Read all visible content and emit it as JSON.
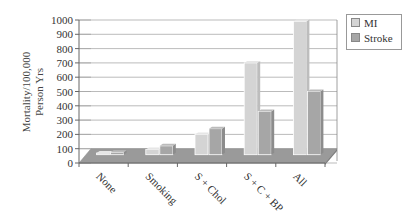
{
  "chart_data": {
    "type": "bar",
    "title": "",
    "xlabel": "",
    "ylabel": "Mortality/100,000 Person Yrs",
    "ylabel_lines": [
      "Mortality/100,000",
      "Person Yrs"
    ],
    "ylim": [
      0,
      1000
    ],
    "yticks": [
      0,
      100,
      200,
      300,
      400,
      500,
      600,
      700,
      800,
      900,
      1000
    ],
    "categories": [
      "None",
      "Smoking",
      "S + Chol",
      "S + C + BP",
      "All"
    ],
    "series": [
      {
        "name": "MI",
        "color": "#d4d4d4",
        "values": [
          70,
          95,
          200,
          700,
          990
        ]
      },
      {
        "name": "Stroke",
        "color": "#a6a6a6",
        "values": [
          75,
          120,
          240,
          360,
          500
        ]
      }
    ],
    "grid": true,
    "legend_position": "right",
    "style": "3d"
  },
  "legend": {
    "items": [
      {
        "label": "MI",
        "color": "#d4d4d4"
      },
      {
        "label": "Stroke",
        "color": "#a6a6a6"
      }
    ]
  }
}
